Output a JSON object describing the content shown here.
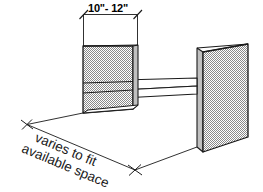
{
  "diagram": {
    "background_color": "#ffffff",
    "line_color": "#1a1a1a",
    "panel_fill_color": "#b4b4b4",
    "shelf_fill_color": "#ffffff",
    "annotations": {
      "width_dimension": {
        "label": "10\"- 12\"",
        "name": "top-width-dimension"
      },
      "depth_dimension": {
        "line1": "varies to fit",
        "line2": "available space",
        "name": "bottom-depth-dimension"
      }
    },
    "parts": [
      {
        "name": "left-panel",
        "label": "left vertical panel"
      },
      {
        "name": "right-panel",
        "label": "right vertical panel"
      },
      {
        "name": "shelf",
        "label": "horizontal shelf"
      }
    ]
  }
}
